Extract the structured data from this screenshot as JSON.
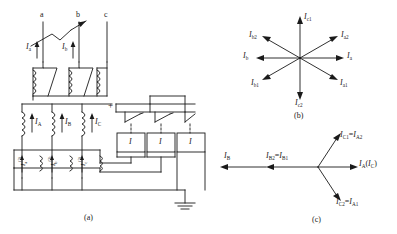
{
  "figure": {
    "panel_a_caption": "(a)",
    "panel_b_caption": "(b)",
    "panel_c_caption": "(c)"
  },
  "panel_a": {
    "phase_terminals": [
      "a",
      "b",
      "c"
    ],
    "primary_currents": [
      {
        "symbol": "I",
        "sub": "a"
      },
      {
        "symbol": "I",
        "sub": "b"
      }
    ],
    "ct_secondary_currents": [
      {
        "symbol": "I",
        "sub": "A"
      },
      {
        "symbol": "I",
        "sub": "B"
      },
      {
        "symbol": "I",
        "sub": "C"
      }
    ],
    "delta_winding_currents": [
      {
        "symbol": "I",
        "sub": "a",
        "sup": "(2)"
      },
      {
        "symbol": "I",
        "sub": "b",
        "sup": "(2)"
      },
      {
        "symbol": "I",
        "sub": "c",
        "sup": "(2)"
      }
    ],
    "relay_labels": [
      "I",
      "I",
      "I"
    ],
    "supply_terminal": "+",
    "ground_symbol": "earth-ground"
  },
  "panel_b": {
    "caption": "(b)",
    "phasors": [
      {
        "label_symbol": "I",
        "label_sub": "c1",
        "angle_deg": 90
      },
      {
        "label_symbol": "I",
        "label_sub": "a2",
        "angle_deg": 30
      },
      {
        "label_symbol": "I",
        "label_sub": "a",
        "angle_deg": 0
      },
      {
        "label_symbol": "I",
        "label_sub": "a1",
        "angle_deg": -30
      },
      {
        "label_symbol": "I",
        "label_sub": "c2",
        "angle_deg": -90
      },
      {
        "label_symbol": "I",
        "label_sub": "b1",
        "angle_deg": -150
      },
      {
        "label_symbol": "I",
        "label_sub": "b",
        "angle_deg": 180
      },
      {
        "label_symbol": "I",
        "label_sub": "b2",
        "angle_deg": 150
      }
    ]
  },
  "panel_c": {
    "caption": "(c)",
    "phasors": [
      {
        "text_parts": [
          {
            "symbol": "I",
            "sub": "C1"
          },
          {
            "plain": "="
          },
          {
            "symbol": "I",
            "sub": "A2"
          }
        ],
        "angle_deg": 60
      },
      {
        "text_parts": [
          {
            "symbol": "I",
            "sub": "A"
          },
          {
            "plain": "("
          },
          {
            "symbol": "I",
            "sub": "C"
          },
          {
            "plain": ")"
          }
        ],
        "angle_deg": 0
      },
      {
        "text_parts": [
          {
            "symbol": "I",
            "sub": "C2"
          },
          {
            "plain": "="
          },
          {
            "symbol": "I",
            "sub": "A1"
          }
        ],
        "angle_deg": -60
      },
      {
        "text_parts": [
          {
            "symbol": "I",
            "sub": "B2"
          },
          {
            "plain": "="
          },
          {
            "symbol": "I",
            "sub": "B1"
          }
        ],
        "angle_deg": 180
      },
      {
        "text_parts": [
          {
            "symbol": "I",
            "sub": "B"
          }
        ],
        "angle_deg": 180
      }
    ]
  },
  "colors": {
    "line": "#1a1a1a",
    "background": "#ffffff",
    "text": "#1a1a1a"
  }
}
